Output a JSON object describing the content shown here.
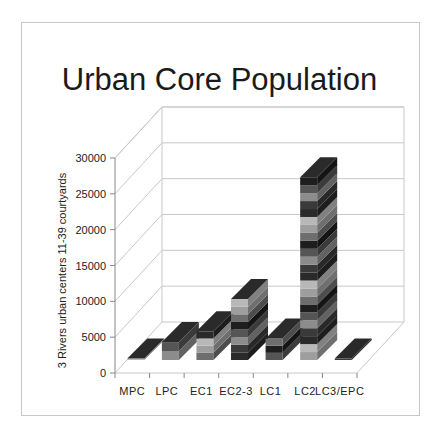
{
  "chart_data": {
    "type": "bar",
    "subtype": "3d-stacked-column",
    "title": "Urban Core Population",
    "xlabel": "",
    "ylabel": "3 Rivers urban centers 11-39 courtyards",
    "ylim": [
      0,
      30000
    ],
    "yticks": [
      0,
      5000,
      10000,
      15000,
      20000,
      25000,
      30000
    ],
    "categories": [
      "MPC",
      "LPC",
      "EC1",
      "EC2-3",
      "LC1",
      "LC2",
      "LC3/EPC"
    ],
    "values": [
      200,
      2500,
      4000,
      8500,
      3000,
      25500,
      200
    ],
    "grid": true,
    "legend": "none",
    "colors": [
      "#b8b8b8",
      "#8c8c8c",
      "#6e6e6e",
      "#2a2a2a",
      "#555555",
      "#9e9e9e",
      "#3a3a3a",
      "#1e1e1e"
    ]
  }
}
